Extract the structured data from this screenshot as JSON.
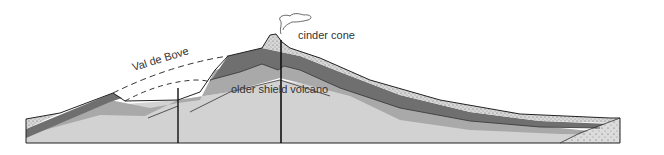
{
  "diagram": {
    "type": "geological cross-section",
    "labels": {
      "cinder_cone": "cinder cone",
      "older_shield_volcano": "older shield volcano",
      "val_de_bove": "Val de Bove"
    },
    "colors": {
      "dark_layer": "#6f6f6f",
      "mid_layer": "#a9a9a9",
      "light_layer": "#d2d2d2",
      "speckled_layer": "#c8c8c8",
      "outline": "#222222",
      "background": "#ffffff"
    },
    "features": [
      "cinder cone with plume",
      "central feeder conduit",
      "secondary conduit beneath Val de Bove",
      "dashed reconstructed former summit profile",
      "speckled pyroclastic surface deposits",
      "basement wedge (dotted) at right"
    ]
  }
}
